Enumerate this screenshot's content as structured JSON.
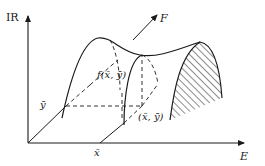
{
  "figure": {
    "axes": {
      "vertical_label": "IR",
      "horizontal_label": "E",
      "x_bar_label": "x̄",
      "y_bar_label": "ȳ"
    },
    "labels": {
      "function_value": "f(x̄, ȳ)",
      "point": "(x̄, ȳ)",
      "direction": "F"
    },
    "colors": {
      "ink": "#1a1a1a",
      "background": "#ffffff"
    }
  }
}
